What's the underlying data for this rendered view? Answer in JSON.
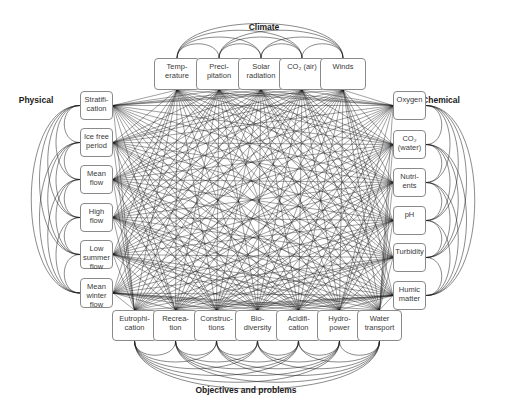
{
  "diagram": {
    "type": "network",
    "line_color": "#1a1a1a",
    "box_border": "#8a8a8a",
    "groups": [
      {
        "id": "climate",
        "label": "Climate",
        "label_pos": [
          264,
          22
        ],
        "side": "top",
        "nodes": [
          {
            "id": "temperature",
            "label": "Temp-\nerature",
            "box": [
              154,
              58,
              46,
              32
            ]
          },
          {
            "id": "precipitation",
            "label": "Preci-\npitation",
            "box": [
              196,
              58,
              46,
              32
            ]
          },
          {
            "id": "solar-radiation",
            "label": "Solar\nradiation",
            "box": [
              238,
              58,
              46,
              32
            ]
          },
          {
            "id": "co2-air",
            "label": "CO₂ (air)",
            "box": [
              279,
              58,
              46,
              32
            ]
          },
          {
            "id": "winds",
            "label": "Winds",
            "box": [
              320,
              58,
              46,
              32
            ]
          }
        ]
      },
      {
        "id": "physical",
        "label": "Physical",
        "label_pos": [
          36,
          95
        ],
        "side": "left",
        "nodes": [
          {
            "id": "stratification",
            "label": "Stratifi-\ncation",
            "box": [
              80,
              91,
              33,
              29
            ]
          },
          {
            "id": "ice-free-period",
            "label": "Ice free\nperiod",
            "box": [
              80,
              128,
              33,
              29
            ]
          },
          {
            "id": "mean-flow",
            "label": "Mean\nflow",
            "box": [
              80,
              165,
              33,
              29
            ]
          },
          {
            "id": "high-flow",
            "label": "High\nflow",
            "box": [
              80,
              203,
              33,
              29
            ]
          },
          {
            "id": "low-summer-flow",
            "label": "Low\nsummer\nflow",
            "box": [
              80,
              240,
              33,
              29
            ]
          },
          {
            "id": "mean-winter-flow",
            "label": "Mean\nwinter\nflow",
            "box": [
              80,
              278,
              33,
              30
            ]
          }
        ]
      },
      {
        "id": "chemical",
        "label": "Chemical",
        "label_pos": [
          441,
          95
        ],
        "side": "right",
        "nodes": [
          {
            "id": "oxygen",
            "label": "Oxygen",
            "box": [
              393,
              91,
              33,
              29
            ]
          },
          {
            "id": "co2-water",
            "label": "CO₂\n(water)",
            "box": [
              393,
              130,
              33,
              29
            ]
          },
          {
            "id": "nutrients",
            "label": "Nutri-\nents",
            "box": [
              393,
              168,
              33,
              29
            ]
          },
          {
            "id": "ph",
            "label": "pH",
            "box": [
              393,
              206,
              33,
              29
            ]
          },
          {
            "id": "turbidity",
            "label": "Turbidity",
            "box": [
              393,
              243,
              33,
              29
            ]
          },
          {
            "id": "humic-matter",
            "label": "Humic\nmatter",
            "box": [
              393,
              281,
              33,
              29
            ]
          }
        ]
      },
      {
        "id": "objectives",
        "label": "Objectives and problems",
        "label_pos": [
          246,
          385
        ],
        "side": "bottom",
        "nodes": [
          {
            "id": "eutrophication",
            "label": "Eutrophi-\ncation",
            "box": [
              112,
              310,
              45,
              31
            ]
          },
          {
            "id": "recreation",
            "label": "Recrea-\ntion",
            "box": [
              153,
              310,
              45,
              31
            ]
          },
          {
            "id": "constructions",
            "label": "Construc-\ntions",
            "box": [
              194,
              310,
              45,
              31
            ]
          },
          {
            "id": "biodiversity",
            "label": "Bio-\ndiversity",
            "box": [
              235,
              310,
              45,
              31
            ]
          },
          {
            "id": "acidification",
            "label": "Acidifi-\ncation",
            "box": [
              276,
              310,
              45,
              31
            ]
          },
          {
            "id": "hydropower",
            "label": "Hydro-\npower",
            "box": [
              317,
              310,
              45,
              31
            ]
          },
          {
            "id": "water-transport",
            "label": "Water\ntransport",
            "box": [
              357,
              310,
              45,
              31
            ]
          }
        ]
      }
    ]
  }
}
